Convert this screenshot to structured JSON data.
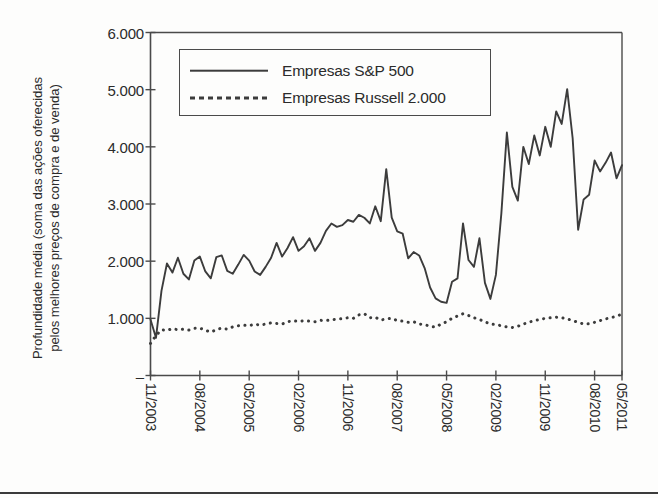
{
  "axis_title": {
    "line1": "Profundidade média (soma das ações oferecidas",
    "line2": "pelos melhores preços de compra e de venda)"
  },
  "legend": {
    "items": [
      {
        "label": "Empresas S&P 500",
        "style": "solid"
      },
      {
        "label": "Empresas Russell 2.000",
        "style": "dotted"
      }
    ]
  },
  "colors": {
    "line": "#3c3c3c",
    "axis": "#4a4a4a",
    "background": "#fdfdfc",
    "text": "#2b2b2b"
  },
  "chart_data": {
    "type": "line",
    "title": "",
    "xlabel": "",
    "ylabel": "Profundidade média (soma das ações oferecidas pelos melhores preços de compra e de venda)",
    "ylim": [
      0,
      6000
    ],
    "ytick_labels": [
      "–",
      "1.000",
      "2.000",
      "3.000",
      "4.000",
      "5.000",
      "6.000"
    ],
    "ytick_values": [
      0,
      1000,
      2000,
      3000,
      4000,
      5000,
      6000
    ],
    "grid": false,
    "legend_position": "upper-left-inside",
    "xtick_labels": [
      "11/2003",
      "08/2004",
      "05/2005",
      "02/2006",
      "11/2006",
      "08/2007",
      "05/2008",
      "02/2009",
      "11/2009",
      "08/2010",
      "05/2011"
    ],
    "x_start": "11/2003",
    "x_end": "05/2011",
    "x_interval_months": 1,
    "xtick_interval_months": 9,
    "series": [
      {
        "name": "Empresas S&P 500",
        "style": "solid",
        "values": [
          980,
          660,
          1480,
          1960,
          1800,
          2060,
          1780,
          1680,
          2010,
          2080,
          1820,
          1700,
          2070,
          2100,
          1830,
          1780,
          1940,
          2110,
          2010,
          1820,
          1760,
          1900,
          2060,
          2320,
          2080,
          2230,
          2420,
          2180,
          2260,
          2400,
          2180,
          2320,
          2530,
          2660,
          2600,
          2630,
          2720,
          2690,
          2810,
          2760,
          2660,
          2960,
          2700,
          3610,
          2760,
          2520,
          2480,
          2050,
          2160,
          2100,
          1880,
          1540,
          1350,
          1290,
          1270,
          1640,
          1700,
          2660,
          2020,
          1900,
          2400,
          1620,
          1340,
          1760,
          2840,
          4250,
          3300,
          3060,
          4000,
          3700,
          4200,
          3850,
          4350,
          4000,
          4620,
          4400,
          5010,
          4150,
          2550,
          3080,
          3160,
          3760,
          3570,
          3720,
          3900,
          3450,
          3680
        ]
      },
      {
        "name": "Empresas Russell 2.000",
        "style": "dotted",
        "values": [
          560,
          700,
          800,
          790,
          820,
          800,
          810,
          795,
          825,
          830,
          790,
          760,
          800,
          830,
          810,
          850,
          870,
          880,
          870,
          900,
          880,
          900,
          920,
          910,
          900,
          940,
          960,
          945,
          960,
          950,
          940,
          965,
          960,
          975,
          985,
          995,
          1010,
          1000,
          1060,
          1080,
          1010,
          1020,
          970,
          990,
          1000,
          960,
          950,
          930,
          940,
          900,
          890,
          860,
          845,
          900,
          940,
          1000,
          1040,
          1080,
          1050,
          1010,
          980,
          940,
          900,
          890,
          870,
          850,
          840,
          860,
          900,
          930,
          960,
          980,
          1000,
          1010,
          1020,
          1010,
          990,
          960,
          930,
          900,
          905,
          930,
          960,
          990,
          1010,
          1040,
          1070
        ]
      }
    ]
  }
}
